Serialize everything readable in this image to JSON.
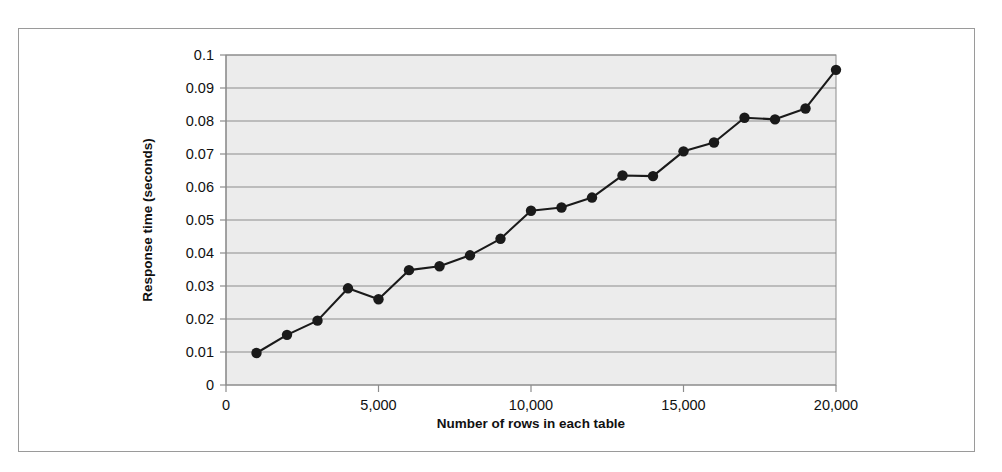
{
  "chart_data": {
    "type": "line",
    "title": "",
    "xlabel": "Number of rows in each table",
    "ylabel": "Response time (seconds)",
    "xlim": [
      0,
      20000
    ],
    "ylim": [
      0,
      0.1
    ],
    "grid": "horizontal",
    "legend": "none",
    "plot_background": "#ececec",
    "line_color": "#1a1a1a",
    "marker": "circle",
    "marker_color": "#1a1a1a",
    "x": [
      1000,
      2000,
      3000,
      4000,
      5000,
      6000,
      7000,
      8000,
      9000,
      10000,
      11000,
      12000,
      13000,
      14000,
      15000,
      16000,
      17000,
      18000,
      19000,
      20000
    ],
    "values": [
      0.0097,
      0.0152,
      0.0195,
      0.0293,
      0.026,
      0.0348,
      0.036,
      0.0393,
      0.0443,
      0.0528,
      0.0538,
      0.0568,
      0.0635,
      0.0633,
      0.0708,
      0.0735,
      0.081,
      0.0805,
      0.0838,
      0.0955
    ],
    "xticks": [
      0,
      5000,
      10000,
      15000,
      20000
    ],
    "xticklabels": [
      "0",
      "5,000",
      "10,000",
      "15,000",
      "20,000"
    ],
    "yticks": [
      0,
      0.01,
      0.02,
      0.03,
      0.04,
      0.05,
      0.06,
      0.07,
      0.08,
      0.09,
      0.1
    ],
    "yticklabels": [
      "0",
      "0.01",
      "0.02",
      "0.03",
      "0.04",
      "0.05",
      "0.06",
      "0.07",
      "0.08",
      "0.09",
      "0.1"
    ]
  },
  "axis_titles": {
    "x": "Number of rows in each table",
    "y": "Response time (seconds)"
  }
}
